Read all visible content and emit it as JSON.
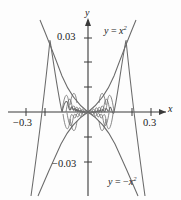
{
  "figure": {
    "labels": {
      "y_axis": "y",
      "x_axis": "x",
      "y_tick_top": "0.03",
      "y_tick_bottom": "−0.03",
      "x_tick_left": "−0.3",
      "x_tick_right": "0.3"
    },
    "curve_labels": {
      "upper": "y = x²",
      "lower": "y = −x²"
    },
    "colors": {
      "curve": "#6b6b6b",
      "axis": "#3a3a3a",
      "background": "#fdfdfd",
      "text": "#1a1a1a"
    }
  },
  "chart_data": {
    "type": "line",
    "title": "",
    "xlabel": "x",
    "ylabel": "y",
    "xlim": [
      -0.36,
      0.36
    ],
    "ylim": [
      -0.045,
      0.045
    ],
    "grid": false,
    "legend": "inline-curve-labels",
    "xticks": [
      -0.3,
      -0.2,
      0.2,
      0.3
    ],
    "xtick_labels": [
      "−0.3",
      "",
      "",
      "0.3"
    ],
    "yticks": [
      -0.03,
      -0.02,
      -0.01,
      0.01,
      0.02,
      0.03
    ],
    "ytick_labels": [
      "−0.03",
      "",
      "",
      "",
      "",
      "0.03"
    ],
    "series": [
      {
        "name": "y = x²",
        "formula": "x^2",
        "x": [
          -0.36,
          -0.3,
          -0.24,
          -0.18,
          -0.12,
          -0.06,
          0.0,
          0.06,
          0.12,
          0.18,
          0.24,
          0.3,
          0.36
        ],
        "values": [
          0.1296,
          0.09,
          0.0576,
          0.0324,
          0.0144,
          0.0036,
          0.0,
          0.0036,
          0.0144,
          0.0324,
          0.0576,
          0.09,
          0.1296
        ]
      },
      {
        "name": "y = −x²",
        "formula": "-x^2",
        "x": [
          -0.36,
          -0.3,
          -0.24,
          -0.18,
          -0.12,
          -0.06,
          0.0,
          0.06,
          0.12,
          0.18,
          0.24,
          0.3,
          0.36
        ],
        "values": [
          -0.1296,
          -0.09,
          -0.0576,
          -0.0324,
          -0.0144,
          -0.0036,
          0.0,
          -0.0036,
          -0.0144,
          -0.0324,
          -0.0576,
          -0.09,
          -0.1296
        ]
      },
      {
        "name": "y = x² sin(1/x)",
        "formula": "x^2*sin(1/x)",
        "note": "oscillating curve squeezed between the two envelopes; oscillations grow infinitely rapid near x = 0"
      }
    ]
  }
}
